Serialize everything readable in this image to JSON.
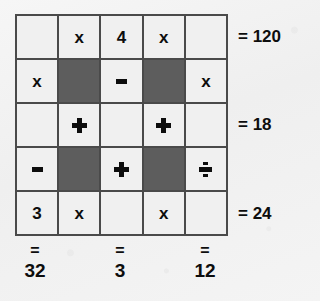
{
  "puzzle": {
    "title": "arithmetic-grid-puzzle",
    "rows": 5,
    "columns": 5,
    "colors": {
      "paper_background": "#f3f3f3",
      "cell_light": "#f0f0f0",
      "cell_dark": "#5d5d5d",
      "grid_line": "#4a4a4a",
      "text": "#0d0d0d"
    },
    "grid": [
      [
        {
          "text": "",
          "kind": "blank",
          "shaded": false
        },
        {
          "text": "x",
          "kind": "text",
          "shaded": false
        },
        {
          "text": "4",
          "kind": "text",
          "shaded": false
        },
        {
          "text": "x",
          "kind": "text",
          "shaded": false
        },
        {
          "text": "",
          "kind": "blank",
          "shaded": false
        }
      ],
      [
        {
          "text": "x",
          "kind": "text",
          "shaded": false
        },
        {
          "text": "",
          "kind": "blank",
          "shaded": true
        },
        {
          "text": "-",
          "kind": "minus",
          "shaded": false
        },
        {
          "text": "",
          "kind": "blank",
          "shaded": true
        },
        {
          "text": "x",
          "kind": "text",
          "shaded": false
        }
      ],
      [
        {
          "text": "",
          "kind": "blank",
          "shaded": false
        },
        {
          "text": "+",
          "kind": "plus",
          "shaded": false
        },
        {
          "text": "",
          "kind": "blank",
          "shaded": false
        },
        {
          "text": "+",
          "kind": "plus",
          "shaded": false
        },
        {
          "text": "",
          "kind": "blank",
          "shaded": false
        }
      ],
      [
        {
          "text": "-",
          "kind": "minus",
          "shaded": false
        },
        {
          "text": "",
          "kind": "blank",
          "shaded": true
        },
        {
          "text": "+",
          "kind": "plus",
          "shaded": false
        },
        {
          "text": "",
          "kind": "blank",
          "shaded": true
        },
        {
          "text": "÷",
          "kind": "divide",
          "shaded": false
        }
      ],
      [
        {
          "text": "3",
          "kind": "text",
          "shaded": false
        },
        {
          "text": "x",
          "kind": "text",
          "shaded": false
        },
        {
          "text": "",
          "kind": "blank",
          "shaded": false
        },
        {
          "text": "x",
          "kind": "text",
          "shaded": false
        },
        {
          "text": "",
          "kind": "blank",
          "shaded": false
        }
      ]
    ],
    "row_results": [
      {
        "row": 1,
        "label": "= 120",
        "equals": "=",
        "value": "120"
      },
      {
        "row": 3,
        "label": "= 18",
        "equals": "=",
        "value": "18"
      },
      {
        "row": 5,
        "label": "= 24",
        "equals": "=",
        "value": "24"
      }
    ],
    "column_results": [
      {
        "column": 1,
        "equals": "=",
        "value": "32"
      },
      {
        "column": 3,
        "equals": "=",
        "value": "3"
      },
      {
        "column": 5,
        "equals": "=",
        "value": "12"
      }
    ]
  }
}
